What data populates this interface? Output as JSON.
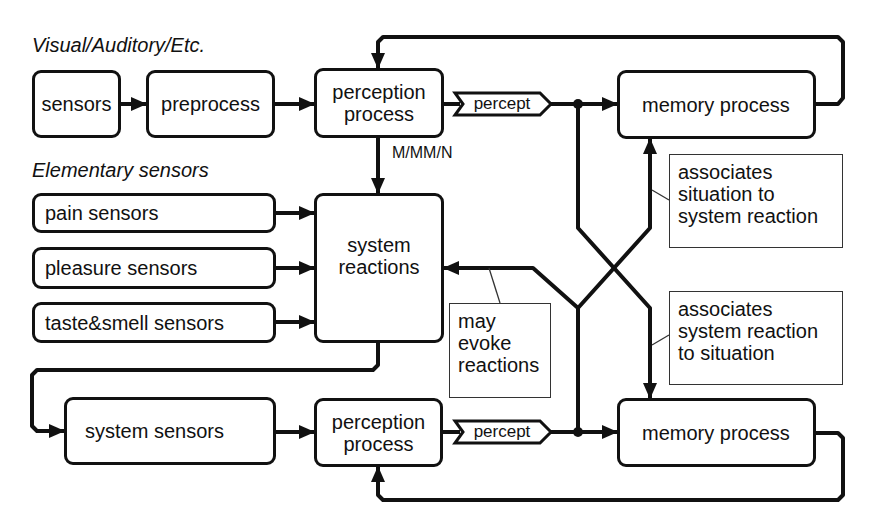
{
  "headings": {
    "visual": "Visual/Auditory/Etc.",
    "elementary": "Elementary sensors"
  },
  "top_row": {
    "sensors": "sensors",
    "preprocess": "preprocess",
    "perception_line1": "perception",
    "perception_line2": "process",
    "percept": "percept",
    "memory": "memory process",
    "mmn_label": "M/MM/N"
  },
  "elementary": {
    "pain": "pain sensors",
    "pleasure": "pleasure sensors",
    "taste_smell": "taste&smell sensors"
  },
  "system_reactions": {
    "line1": "system",
    "line2": "reactions"
  },
  "bottom_row": {
    "system_sensors": "system sensors",
    "perception_line1": "perception",
    "perception_line2": "process",
    "percept": "percept",
    "memory": "memory process"
  },
  "notes": {
    "situation_to_reaction": [
      "associates",
      "situation to",
      "system reaction"
    ],
    "reaction_to_situation": [
      "associates",
      "system reaction",
      "to situation"
    ],
    "may_evoke": [
      "may",
      "evoke",
      "reactions"
    ]
  }
}
